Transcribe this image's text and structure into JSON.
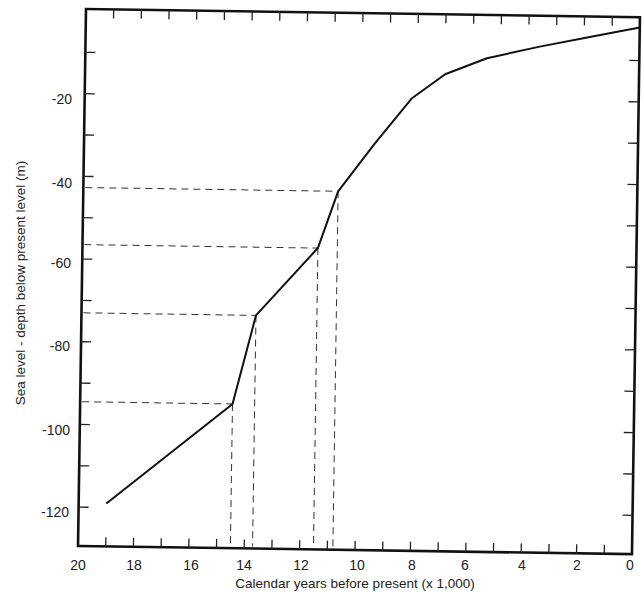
{
  "chart_data": {
    "type": "line",
    "title": "",
    "xlabel": "Calendar years before present (x 1,000)",
    "ylabel": "Sea level - depth below present level (m)",
    "xlim": [
      20,
      0
    ],
    "ylim": [
      -128,
      0
    ],
    "x_reversed": true,
    "grid": false,
    "legend": null,
    "x_ticks": [
      20,
      18,
      16,
      14,
      12,
      10,
      8,
      6,
      4,
      2,
      0
    ],
    "x_tick_labels": [
      "20",
      "18",
      "16",
      "14",
      "12",
      "10",
      "8",
      "6",
      "4",
      "2",
      "0"
    ],
    "x_minor_ticks": [
      19,
      18,
      17,
      16,
      15,
      14,
      13,
      12,
      11,
      10,
      9,
      8,
      7,
      6,
      5,
      4,
      3,
      2,
      1
    ],
    "y_ticks": [
      -20,
      -40,
      -60,
      -80,
      -100,
      -120
    ],
    "y_tick_labels": [
      "-20",
      "-40",
      "-60",
      "-80",
      "-100",
      "-120"
    ],
    "y_minor_ticks": [
      -10,
      -20,
      -30,
      -40,
      -50,
      -60,
      -70,
      -80,
      -90,
      -100,
      -110,
      -120
    ],
    "series": [
      {
        "name": "Sea level",
        "style": "solid",
        "x": [
          19.0,
          14.5,
          13.7,
          11.5,
          10.8,
          9.5,
          8.2,
          7.0,
          5.5,
          3.6,
          1.8,
          0.0
        ],
        "y": [
          -119,
          -94.5,
          -73,
          -56.5,
          -42.7,
          -31,
          -20,
          -14,
          -10,
          -7,
          -4.5,
          -2
        ]
      }
    ],
    "annotations": [
      {
        "type": "dashed-guide",
        "x": 14.5,
        "y": -94.5
      },
      {
        "type": "dashed-guide",
        "x": 13.7,
        "y": -73
      },
      {
        "type": "dashed-guide",
        "x": 11.5,
        "y": -56.5
      },
      {
        "type": "dashed-guide",
        "x": 10.8,
        "y": -42.7
      }
    ]
  }
}
